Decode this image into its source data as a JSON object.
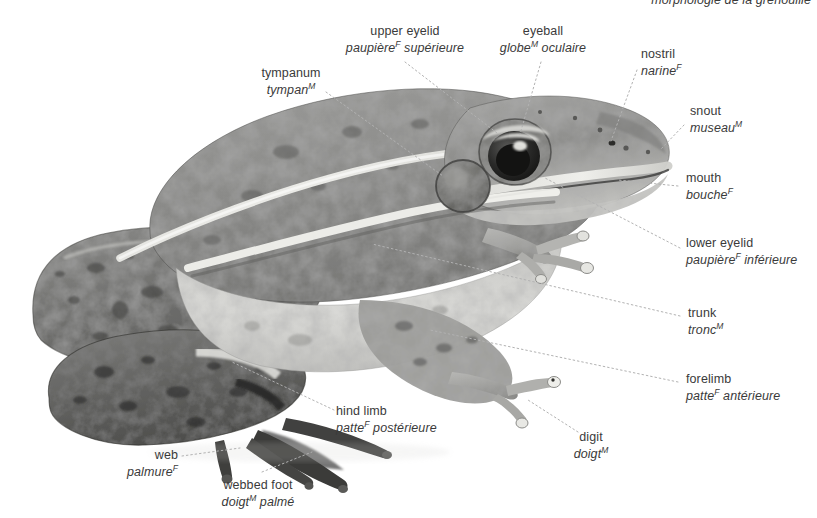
{
  "title": {
    "text": "morphologie  de la grenouille",
    "note": "cropped at top edge of image"
  },
  "diagram": {
    "style": "grayscale photographic illustration, lateral view facing right",
    "background_color": "#ffffff",
    "text_color": "#3a3a3a",
    "leader_color": "#b0b0b0"
  },
  "labels": [
    {
      "id": "upper-eyelid",
      "en": "upper eyelid",
      "fr_word": "paupière",
      "fr_gender": "F",
      "fr_rest": " supérieure",
      "align": "center"
    },
    {
      "id": "eyeball",
      "en": "eyeball",
      "fr_word": "globe",
      "fr_gender": "M",
      "fr_rest": " oculaire",
      "align": "center"
    },
    {
      "id": "nostril",
      "en": "nostril",
      "fr_word": "narine",
      "fr_gender": "F",
      "fr_rest": "",
      "align": "left"
    },
    {
      "id": "snout",
      "en": "snout",
      "fr_word": "museau",
      "fr_gender": "M",
      "fr_rest": "",
      "align": "left"
    },
    {
      "id": "tympanum",
      "en": "tympanum",
      "fr_word": "tympan",
      "fr_gender": "M",
      "fr_rest": "",
      "align": "center"
    },
    {
      "id": "mouth",
      "en": "mouth",
      "fr_word": "bouche",
      "fr_gender": "F",
      "fr_rest": "",
      "align": "left"
    },
    {
      "id": "lower-eyelid",
      "en": "lower eyelid",
      "fr_word": "paupière",
      "fr_gender": "F",
      "fr_rest": " inférieure",
      "align": "left"
    },
    {
      "id": "trunk",
      "en": "trunk",
      "fr_word": "tronc",
      "fr_gender": "M",
      "fr_rest": "",
      "align": "left"
    },
    {
      "id": "forelimb",
      "en": "forelimb",
      "fr_word": "patte",
      "fr_gender": "F",
      "fr_rest": " antérieure",
      "align": "left"
    },
    {
      "id": "digit",
      "en": "digit",
      "fr_word": "doigt",
      "fr_gender": "M",
      "fr_rest": "",
      "align": "center"
    },
    {
      "id": "hind-limb",
      "en": "hind limb",
      "fr_word": "patte",
      "fr_gender": "F",
      "fr_rest": " postérieure",
      "align": "left"
    },
    {
      "id": "web",
      "en": "web",
      "fr_word": "palmure",
      "fr_gender": "F",
      "fr_rest": "",
      "align": "right"
    },
    {
      "id": "webbed-foot",
      "en": "webbed foot",
      "fr_word": "doigt",
      "fr_gender": "M",
      "fr_rest": " palmé",
      "align": "center"
    }
  ]
}
